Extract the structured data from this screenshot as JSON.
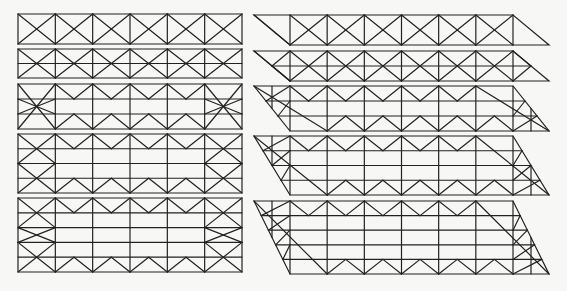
{
  "figure": {
    "stroke_color": "#222222",
    "background_color": "#f7f7f5"
  },
  "geometry": {
    "columns": 6,
    "left": {
      "x0": 18,
      "x1": 242
    },
    "right": {
      "top_x0": 254,
      "rect_x0": 290,
      "rect_x1": 513,
      "bottom_x1": 550,
      "skew": 36
    }
  },
  "panels": {
    "left": [
      {
        "id": "rect-1",
        "y0": 14,
        "y1": 44,
        "rows": 1,
        "pattern": "x-brace"
      },
      {
        "id": "rect-2",
        "y0": 49,
        "y1": 78,
        "rows": 2,
        "pattern": "x-brace-mid-chord"
      },
      {
        "id": "rect-3",
        "y0": 84,
        "y1": 129,
        "rows": 3,
        "pattern": "zigzag-top-bottom-end-x"
      },
      {
        "id": "rect-4",
        "y0": 134,
        "y1": 193,
        "rows": 4,
        "pattern": "zigzag-top-bottom-end-double-x"
      },
      {
        "id": "rect-5",
        "y0": 198,
        "y1": 272,
        "rows": 5,
        "pattern": "zigzag-top-bottom-end-triple-x"
      }
    ],
    "right": [
      {
        "id": "para-1",
        "y0": 15,
        "y1": 45,
        "rows": 1,
        "pattern": "x-brace"
      },
      {
        "id": "para-2",
        "y0": 51,
        "y1": 81,
        "rows": 2,
        "pattern": "x-brace-mid-chord"
      },
      {
        "id": "para-3",
        "y0": 86,
        "y1": 131,
        "rows": 3,
        "pattern": "zigzag-top-bottom-end-fill"
      },
      {
        "id": "para-4",
        "y0": 136,
        "y1": 195,
        "rows": 4,
        "pattern": "zigzag-top-bottom-end-fill"
      },
      {
        "id": "para-5",
        "y0": 201,
        "y1": 274,
        "rows": 5,
        "pattern": "zigzag-top-bottom-end-fill"
      }
    ]
  }
}
